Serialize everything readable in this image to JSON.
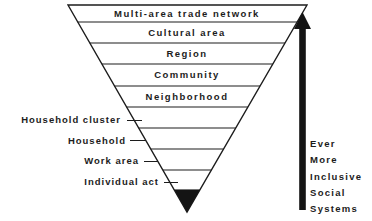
{
  "pyramid": {
    "levels": [
      {
        "label": "Multi-area trade network",
        "placement": "inside"
      },
      {
        "label": "Cultural area",
        "placement": "inside"
      },
      {
        "label": "Region",
        "placement": "inside"
      },
      {
        "label": "Community",
        "placement": "inside"
      },
      {
        "label": "Neighborhood",
        "placement": "inside"
      },
      {
        "label": "Household cluster",
        "placement": "outside-left"
      },
      {
        "label": "Household",
        "placement": "outside-left"
      },
      {
        "label": "Work area",
        "placement": "outside-left"
      },
      {
        "label": "Individual act",
        "placement": "outside-left"
      }
    ]
  },
  "arrow": {
    "direction": "up",
    "caption_lines": [
      "Ever",
      "More",
      "Inclusive",
      "Social",
      "Systems"
    ]
  },
  "colors": {
    "ink": "#1c1c1c",
    "background": "#ffffff"
  }
}
